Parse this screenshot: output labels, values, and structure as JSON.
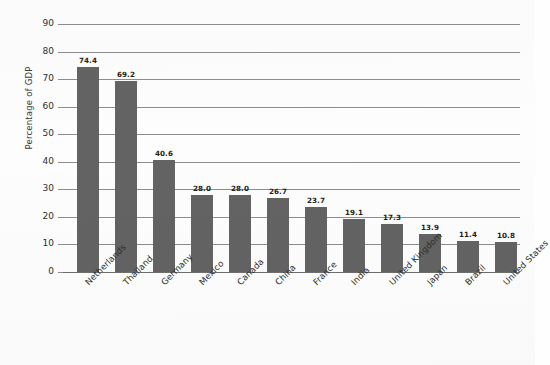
{
  "chart_data": {
    "type": "bar",
    "title": "",
    "subtitle": "",
    "xlabel": "",
    "ylabel": "Percentage of GDP",
    "ylim": [
      0,
      90
    ],
    "ytick_step": 10,
    "ytick_labels": [
      "90",
      "80",
      "70",
      "60",
      "50",
      "40",
      "30",
      "20",
      "10",
      "0"
    ],
    "grid": true,
    "legend": "none",
    "bar_color": "#636363",
    "gridline_color": "#8d8d8d",
    "value_label_format": "one-decimal",
    "categories": [
      "Netherlands",
      "Thailand",
      "Germany",
      "Mexico",
      "Canada",
      "China",
      "France",
      "India",
      "United Kingdom",
      "Japan",
      "Brazil",
      "United States"
    ],
    "values": [
      74.4,
      69.2,
      40.6,
      28.0,
      28.0,
      26.7,
      23.7,
      19.1,
      17.3,
      13.9,
      11.4,
      10.8
    ],
    "value_labels": [
      "74.4",
      "69.2",
      "40.6",
      "28.0",
      "28.0",
      "26.7",
      "23.7",
      "19.1",
      "17.3",
      "13.9",
      "11.4",
      "10.8"
    ]
  }
}
